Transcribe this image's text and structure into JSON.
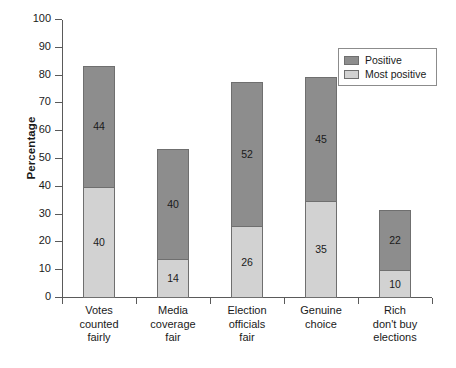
{
  "chart_data": {
    "type": "bar",
    "subtype": "stacked-vertical",
    "title": "",
    "xlabel": "",
    "ylabel": "Percentage",
    "ylim": [
      0,
      100
    ],
    "ytick_step": 10,
    "yticks": [
      0,
      10,
      20,
      30,
      40,
      50,
      60,
      70,
      80,
      90,
      100
    ],
    "grid": false,
    "legend_position": "top-right",
    "categories": [
      "Votes counted fairly",
      "Media coverage fair",
      "Election officials fair",
      "Genuine choice",
      "Rich don't buy elections"
    ],
    "category_label_lines": [
      [
        "Votes",
        "counted",
        "fairly"
      ],
      [
        "Media",
        "coverage",
        "fair"
      ],
      [
        "Election",
        "officials",
        "fair"
      ],
      [
        "Genuine",
        "choice"
      ],
      [
        "Rich",
        "don't buy",
        "elections"
      ]
    ],
    "series": [
      {
        "name": "Most positive",
        "color": "#d2d2d2",
        "values": [
          40,
          14,
          26,
          35,
          10
        ]
      },
      {
        "name": "Positive",
        "color": "#8d8d8d",
        "values": [
          44,
          40,
          52,
          45,
          22
        ]
      }
    ],
    "totals": [
      84,
      54,
      78,
      80,
      32
    ]
  },
  "legend": {
    "entries": [
      {
        "label": "Positive",
        "color": "#8d8d8d"
      },
      {
        "label": "Most positive",
        "color": "#d2d2d2"
      }
    ]
  }
}
